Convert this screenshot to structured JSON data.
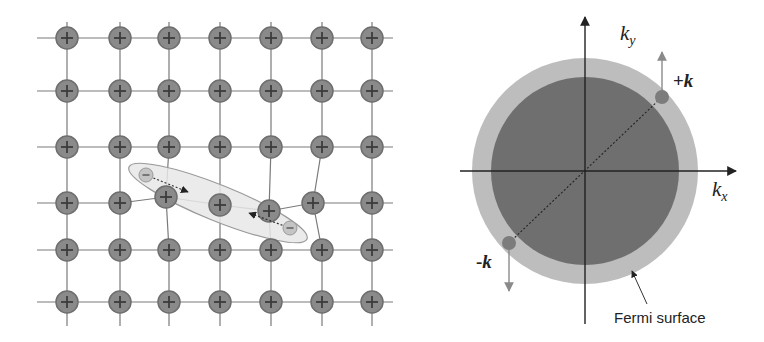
{
  "colors": {
    "ion_fill": "#8a8a8a",
    "ion_stroke": "#6e6e6e",
    "ion_cross": "#3c3c3c",
    "lattice_line": "#7a7a7a",
    "pair_ellipse_fill": "#e8e8e8",
    "pair_ellipse_stroke": "#9a9a9a",
    "electron_fill": "#c4c4c4",
    "fermi_inner": "#6f6f6f",
    "fermi_outer": "#bdbdbd",
    "axis": "#222222",
    "k_dot": "#7c7c7c",
    "k_arrow": "#8a8a8a"
  },
  "lattice": {
    "columns_x": [
      67,
      120,
      169,
      220,
      271,
      322,
      372
    ],
    "rows_y": [
      38,
      91,
      147,
      203,
      250,
      302
    ],
    "ion_symbol": "+",
    "ion_radius": 11,
    "displaced_ions": [
      {
        "row": 3,
        "col": 2,
        "x": 166,
        "y": 197
      },
      {
        "row": 3,
        "col": 3,
        "x": 220,
        "y": 205
      },
      {
        "row": 3,
        "col": 4,
        "x": 269,
        "y": 211
      },
      {
        "row": 3,
        "col": 5,
        "x": 313,
        "y": 203
      }
    ]
  },
  "cooper_pair": {
    "ellipse": {
      "cx": 218,
      "cy": 203,
      "rx": 96,
      "ry": 18,
      "rotate": 22
    },
    "electrons": [
      {
        "x": 146,
        "y": 175,
        "symbol": "−",
        "arrow_to": {
          "x": 188,
          "y": 192
        }
      },
      {
        "x": 290,
        "y": 228,
        "symbol": "−",
        "arrow_to": {
          "x": 249,
          "y": 213
        }
      }
    ]
  },
  "fermi_diagram": {
    "center": {
      "x": 585,
      "y": 171
    },
    "outer_radius": 113,
    "inner_radius": 94,
    "axes": {
      "x_label": "k",
      "x_sub": "x",
      "y_label": "k",
      "y_sub": "y"
    },
    "plus_k": {
      "label_sign": "+",
      "label_k": "k",
      "dot": {
        "x": 662,
        "y": 97
      },
      "arrow_tip": {
        "x": 662,
        "y": 52
      }
    },
    "minus_k": {
      "label_sign": "-",
      "label_k": "k",
      "dot": {
        "x": 509,
        "y": 243
      },
      "arrow_tip": {
        "x": 509,
        "y": 291
      }
    },
    "fermi_surface_label": "Fermi surface"
  }
}
